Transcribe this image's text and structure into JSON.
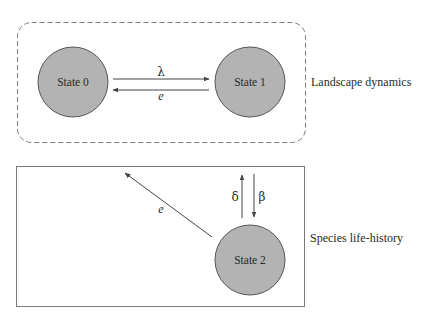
{
  "diagram": {
    "colors": {
      "state_fill": "#b3b3b3",
      "state_stroke": "#555555",
      "arrow": "#444444",
      "box_stroke": "#777777",
      "text": "#2a2a2a"
    },
    "groups": [
      {
        "id": "landscape",
        "label": "Landscape dynamics",
        "border": "dashed-rounded"
      },
      {
        "id": "life-history",
        "label": "Species life-history",
        "border": "solid"
      }
    ],
    "states": [
      {
        "id": "state0",
        "label": "State 0",
        "group": "landscape"
      },
      {
        "id": "state1",
        "label": "State 1",
        "group": "landscape"
      },
      {
        "id": "state2",
        "label": "State 2",
        "group": "life-history"
      }
    ],
    "transitions": [
      {
        "id": "lambda",
        "from": "State 0",
        "to": "State 1",
        "label": "λ"
      },
      {
        "id": "e-landscape",
        "from": "State 1",
        "to": "State 0",
        "label": "e"
      },
      {
        "id": "e-lifehistory",
        "from": "State 2",
        "to": "landscape",
        "label": "e"
      },
      {
        "id": "delta",
        "from": "State 2",
        "to": "upward",
        "label": "δ"
      },
      {
        "id": "beta",
        "from": "upward",
        "to": "State 2",
        "label": "β"
      }
    ]
  }
}
